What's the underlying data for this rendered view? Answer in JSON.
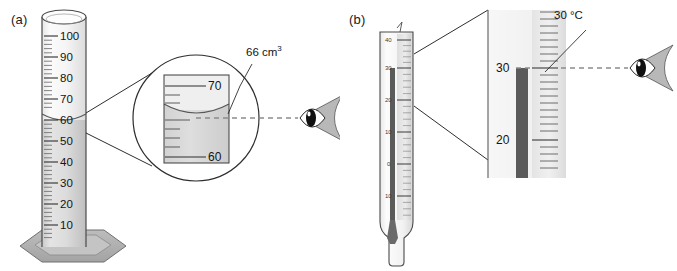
{
  "figure": {
    "panels": [
      {
        "id": "a",
        "label": "(a)",
        "instrument": "measuring-cylinder",
        "scale_unit": "cm3",
        "scale_labels": [
          "100",
          "90",
          "80",
          "70",
          "60",
          "50",
          "40",
          "30",
          "20",
          "10"
        ],
        "liquid_level": 66,
        "magnifier": {
          "top_label": "70",
          "bottom_label": "60"
        },
        "callout": {
          "value": "66",
          "unit": "cm",
          "exponent": "3",
          "text": "66 cm3"
        },
        "eye_icon": "eye-icon",
        "sight_line": "dashed"
      },
      {
        "id": "b",
        "label": "(b)",
        "instrument": "thermometer",
        "scale_unit": "degC",
        "scale_labels": [
          "40",
          "30",
          "20",
          "10",
          "0",
          "10"
        ],
        "reading": 30,
        "magnifier": {
          "top_label": "30",
          "bottom_label": "20"
        },
        "callout": {
          "value": "30",
          "unit": "°C",
          "text": "30 °C"
        },
        "eye_icon": "eye-icon",
        "sight_line": "dashed"
      }
    ]
  },
  "colors": {
    "outline": "#3c3c3c",
    "liquid": "#cfcfcf",
    "glass_light": "#f3f3f3",
    "glass_mid": "#e2e2e2",
    "base_gray": "#b0b0b0",
    "mercury": "#5a5a5a",
    "dashed_line": "#8c8c8c",
    "text": "#141414"
  }
}
